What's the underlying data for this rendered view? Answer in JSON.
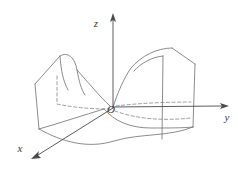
{
  "figure": {
    "kind": "3d-surface-plot",
    "surface_name": "hyperbolic paraboloid (saddle surface)",
    "background_color": "#ffffff",
    "line_color": "#6e6e6e",
    "axis_color": "#4a4a4a",
    "hidden_line_color": "#7d7d7d",
    "width": 238,
    "height": 169
  },
  "labels": {
    "z_axis": "z",
    "y_axis": "y",
    "x_axis": "x",
    "origin": "O"
  },
  "chart_data": {
    "type": "line",
    "title": "",
    "subtitle": "",
    "xlabel": "x",
    "ylabel": "y",
    "zlabel": "z",
    "grid": false,
    "legend": "none",
    "annotations": [
      "O"
    ],
    "axes": [
      {
        "name": "z",
        "label": "z",
        "direction": "up",
        "origin_px": [
          113,
          108
        ],
        "tip_px": [
          113,
          14
        ],
        "arrowhead": true
      },
      {
        "name": "y",
        "label": "y",
        "direction": "right",
        "origin_px": [
          113,
          108
        ],
        "tip_px": [
          228,
          106
        ],
        "arrowhead": true
      },
      {
        "name": "x",
        "label": "x",
        "direction": "down-left",
        "origin_px": [
          113,
          108
        ],
        "tip_px": [
          32,
          159
        ],
        "arrowhead": true
      }
    ],
    "surface": {
      "equation_family": "z = x^2 - y^2",
      "visible_edges": [
        {
          "name": "left-back-rim",
          "path": "M 60 56 C 68 52 74 58 76 70 C 78 80 80 88 84 94"
        },
        {
          "name": "left-front-rim",
          "path": "M 60 56 C 62 70 64 80 68 88"
        },
        {
          "name": "left-outer-top",
          "path": "M 60 56 L 36 84"
        },
        {
          "name": "left-outer-bottom",
          "path": "M 36 84 L 40 128"
        },
        {
          "name": "left-lower-front",
          "path": "M 40 128 C 62 122 84 114 103 109"
        },
        {
          "name": "left-crest-to-origin",
          "path": "M 76 70 C 88 82 100 97 111 107"
        },
        {
          "name": "right-back-rim",
          "path": "M 172 48 C 158 48 142 56 131 68 C 124 76 118 90 113 107"
        },
        {
          "name": "right-front-rim",
          "path": "M 133 72 C 140 64 152 58 163 56"
        },
        {
          "name": "right-outer-top",
          "path": "M 172 48 L 194 64"
        },
        {
          "name": "right-outer-bottom",
          "path": "M 194 64 L 192 126"
        },
        {
          "name": "right-inner-vertical",
          "path": "M 163 56 L 163 138"
        },
        {
          "name": "bottom-front-curve",
          "path": "M 40 128 C 62 141 88 148 113 140 C 140 132 168 136 192 126"
        },
        {
          "name": "lower-saddle-valley",
          "path": "M 103 109 C 112 120 128 128 150 128 C 170 128 182 128 192 126"
        }
      ],
      "hidden_edges": [
        {
          "name": "left-hidden-vertical",
          "path": "M 58 76 L 58 104"
        },
        {
          "name": "left-hidden-curve",
          "path": "M 58 104 C 76 108 96 109 110 109"
        },
        {
          "name": "right-hidden-upper",
          "path": "M 115 106 C 140 104 168 103 190 103"
        },
        {
          "name": "right-hidden-lower",
          "path": "M 114 110 C 136 118 162 120 190 118"
        }
      ]
    }
  }
}
